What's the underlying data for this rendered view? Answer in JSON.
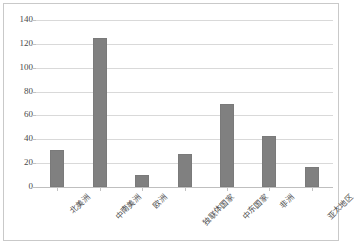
{
  "chart_data": {
    "type": "bar",
    "title": "",
    "subtitle": "",
    "xlabel": "",
    "ylabel": "",
    "categories": [
      "北美洲",
      "中南美洲",
      "欧洲",
      "独联体国家",
      "中东国家",
      "非洲",
      "亚太地区"
    ],
    "values": [
      31,
      125,
      10,
      28,
      70,
      43,
      17
    ],
    "series": [
      {
        "name": "",
        "values": [
          31,
          125,
          10,
          28,
          70,
          43,
          17
        ]
      }
    ],
    "ylim": [
      0,
      140
    ],
    "yticks": [
      0,
      20,
      40,
      60,
      80,
      100,
      120,
      140
    ],
    "ytick_labels": [
      "0",
      "20",
      "40",
      "60",
      "80",
      "100",
      "120",
      "140"
    ],
    "grid": true,
    "grid_axis": "y",
    "legend": false,
    "legend_position": "none",
    "bar_color": "#808080",
    "grid_color": "#d9d9d9",
    "axis_color": "#bfbfbf",
    "text_color": "#4a4a4a",
    "background": "#ffffff",
    "xtick_rotation": -45,
    "annotations": []
  }
}
